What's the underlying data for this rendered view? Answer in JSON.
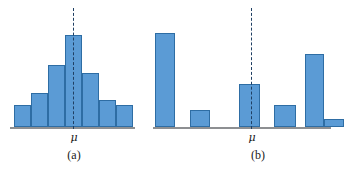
{
  "figure": {
    "background_color": "#ffffff",
    "bar_fill_color": "#5b9bd5",
    "bar_stroke_color": "#2e6da4",
    "axis_color": "#8d8f92",
    "mu_line_color": "#1f3f63",
    "mu_symbol": "μ"
  },
  "panels": [
    {
      "id": "a",
      "caption": "(a)",
      "mu_label": "μ",
      "description": "symmetric bell-shaped histogram centered on mu"
    },
    {
      "id": "b",
      "caption": "(b)",
      "mu_label": "μ",
      "description": "irregular spread-out distribution with gaps, mean at mu"
    }
  ],
  "chart_data": [
    {
      "type": "bar",
      "title": "(a)",
      "xlabel": "",
      "ylabel": "",
      "categories": [
        "1",
        "2",
        "3",
        "4",
        "5",
        "6",
        "7"
      ],
      "values": [
        22,
        34,
        62,
        92,
        54,
        27,
        22
      ],
      "ylim": [
        0,
        100
      ],
      "grid": false,
      "legend": false,
      "annotations": [
        {
          "text": "μ",
          "x": "4",
          "type": "vertical-dashed-line"
        }
      ],
      "bar_gap": 0,
      "axis_baseline": true
    },
    {
      "type": "bar",
      "title": "(b)",
      "xlabel": "",
      "ylabel": "",
      "categories": [
        "1",
        "2",
        "3",
        "4",
        "5",
        "6"
      ],
      "values": [
        94,
        17,
        43,
        22,
        73,
        8
      ],
      "ylim": [
        0,
        100
      ],
      "grid": false,
      "legend": false,
      "annotations": [
        {
          "text": "μ",
          "x": "3",
          "type": "vertical-dashed-line"
        }
      ],
      "bar_gap": 1,
      "axis_baseline": true
    }
  ]
}
